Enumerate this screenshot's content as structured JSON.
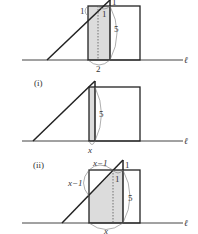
{
  "panels": [
    {
      "id": "top",
      "label": "",
      "line_label": "ℓ",
      "labels": {
        "left_one": "1",
        "top_one": "1",
        "inner_one": "1",
        "height": "5",
        "bottom": "2"
      }
    },
    {
      "id": "i",
      "label": "(i)",
      "line_label": "ℓ",
      "labels": {
        "height": "5",
        "bottom": "x"
      }
    },
    {
      "id": "ii",
      "label": "(ii)",
      "line_label": "ℓ",
      "labels": {
        "top": "x−1",
        "left": "x−1",
        "top_one": "1",
        "inner_one": "1",
        "height": "5",
        "bottom": "x"
      }
    }
  ],
  "colors": {
    "stroke": "#222222",
    "shade": "#dcdcdc",
    "label": "#333333"
  }
}
